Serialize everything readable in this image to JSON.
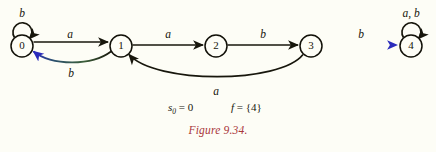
{
  "figure": {
    "caption": "Figure 9.34.",
    "caption_color": "#a9363a",
    "background_color": "#fdfdf6",
    "ink_color": "#17160c",
    "accent_color": "#2a2bbb"
  },
  "automaton": {
    "states": [
      {
        "id": "0",
        "label": "0",
        "cx": 22,
        "cy": 46,
        "r": 11,
        "is_start": true,
        "is_final": false
      },
      {
        "id": "1",
        "label": "1",
        "cx": 121,
        "cy": 46,
        "r": 11,
        "is_start": false,
        "is_final": false
      },
      {
        "id": "2",
        "label": "2",
        "cx": 216,
        "cy": 46,
        "r": 11,
        "is_start": false,
        "is_final": false
      },
      {
        "id": "3",
        "label": "3",
        "cx": 311,
        "cy": 46,
        "r": 11,
        "is_start": false,
        "is_final": false
      },
      {
        "id": "4",
        "label": "4",
        "cx": 411,
        "cy": 46,
        "r": 11,
        "is_start": false,
        "is_final": true
      }
    ],
    "transitions": [
      {
        "from": "0",
        "to": "0",
        "label": "b",
        "kind": "self-loop",
        "label_x": 22,
        "label_y": 13
      },
      {
        "from": "0",
        "to": "1",
        "label": "a",
        "kind": "straight",
        "label_x": 70,
        "label_y": 38
      },
      {
        "from": "1",
        "to": "0",
        "label": "b",
        "kind": "curve-below",
        "label_x": 71,
        "label_y": 74
      },
      {
        "from": "1",
        "to": "2",
        "label": "a",
        "kind": "straight",
        "label_x": 168,
        "label_y": 38
      },
      {
        "from": "2",
        "to": "3",
        "label": "b",
        "kind": "straight",
        "label_x": 263,
        "label_y": 38
      },
      {
        "from": "3",
        "to": "1",
        "label": "a",
        "kind": "curve-below-long",
        "label_x": 216,
        "label_y": 92
      },
      {
        "from": "3",
        "to": "4",
        "label": "b",
        "kind": "straight-accent",
        "label_x": 361,
        "label_y": 38
      },
      {
        "from": "4",
        "to": "4",
        "label": "a, b",
        "kind": "self-loop",
        "label_x": 411,
        "label_y": 13
      }
    ],
    "start_state_spec": {
      "symbol": "s",
      "subscript": "0",
      "equals": "=",
      "value": "0"
    },
    "final_state_spec": {
      "symbol": "f",
      "equals": "=",
      "value": "{4}"
    }
  }
}
